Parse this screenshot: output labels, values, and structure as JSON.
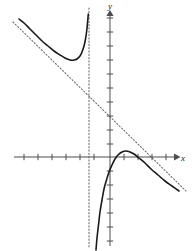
{
  "figure": {
    "name": "rational-function-graph",
    "width": 192,
    "height": 251,
    "background_color": "#ffffff",
    "curve_color": "#1a1a1a",
    "axis_color": "#4d4d4d",
    "asymptote_color": "#6e6e6e"
  },
  "axes": {
    "x_axis_label": "x",
    "y_axis_label": "y",
    "origin_px": {
      "x": 110,
      "y": 157
    },
    "tick_spacing_px": 14,
    "x_axis_line": {
      "x1": 14,
      "y1": 157,
      "x2": 176,
      "y2": 157
    },
    "y_axis_line": {
      "x1": 110,
      "y1": 246,
      "x2": 110,
      "y2": 14
    },
    "x_ticks_px": [
      24,
      38,
      52,
      66,
      80,
      94,
      124,
      138,
      152,
      166
    ],
    "y_ticks_px": [
      18,
      32,
      46,
      60,
      74,
      88,
      102,
      116,
      130,
      144,
      171,
      185,
      199,
      213,
      227,
      241
    ],
    "tick_half_length_px": 3,
    "arrowheads": [
      "x-positive",
      "y-positive"
    ]
  },
  "chart_data": {
    "type": "line",
    "title": "",
    "xlabel": "x",
    "ylabel": "y",
    "grid": false,
    "legend": null,
    "xlim": [
      -6.857,
      4.714
    ],
    "ylim": [
      -6.714,
      10.214
    ],
    "annotations": [
      {
        "kind": "vertical-asymptote",
        "style": "dotted",
        "x": -1.5,
        "pixel_x": 89,
        "pixel_y_top": 8,
        "pixel_y_bottom": 248
      },
      {
        "kind": "slant-asymptote",
        "style": "dotted",
        "pixel_x1": 13,
        "pixel_y1": 22,
        "pixel_x2": 186,
        "pixel_y2": 191
      }
    ],
    "series": [
      {
        "name": "left-branch",
        "style": "solid",
        "points_px": [
          [
            19,
            19
          ],
          [
            24,
            23
          ],
          [
            30,
            29
          ],
          [
            36,
            35
          ],
          [
            42,
            41
          ],
          [
            48,
            46
          ],
          [
            54,
            51
          ],
          [
            60,
            55
          ],
          [
            65,
            58
          ],
          [
            70,
            60
          ],
          [
            74,
            60
          ],
          [
            77,
            59
          ],
          [
            80,
            56
          ],
          [
            82,
            52
          ],
          [
            84,
            46
          ],
          [
            85.5,
            39
          ],
          [
            86.7,
            31
          ],
          [
            87.6,
            22
          ],
          [
            88.3,
            14
          ]
        ]
      },
      {
        "name": "right-branch",
        "style": "solid",
        "points_px": [
          [
            96,
            250
          ],
          [
            97,
            238
          ],
          [
            98.5,
            225
          ],
          [
            100,
            212
          ],
          [
            102,
            200
          ],
          [
            104,
            189
          ],
          [
            106.5,
            180
          ],
          [
            109,
            172
          ],
          [
            112,
            165
          ],
          [
            115,
            159
          ],
          [
            118,
            155
          ],
          [
            122,
            152
          ],
          [
            126,
            151
          ],
          [
            130,
            152
          ],
          [
            134,
            154
          ],
          [
            139,
            158
          ],
          [
            145,
            163
          ],
          [
            151,
            169
          ],
          [
            158,
            175
          ],
          [
            165,
            181
          ],
          [
            172,
            186
          ],
          [
            179,
            191
          ]
        ]
      }
    ]
  }
}
